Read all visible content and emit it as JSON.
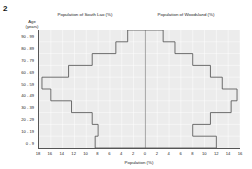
{
  "figure": {
    "number": "2"
  },
  "titles": {
    "left": "Population of South Lao (%)",
    "right": "Population of Woodsland (%)"
  },
  "axes": {
    "y_label": "Age\n(years)",
    "y_label_line1": "Age",
    "y_label_line2": "(years)",
    "x_label": "Population (%)"
  },
  "chart_data": {
    "type": "bar",
    "subtitle": "",
    "orientation": "horizontal-back-to-back",
    "style": "step-outline",
    "xlabel": "Population (%)",
    "ylabel": "Age (years)",
    "grid": true,
    "legend": "none",
    "categories": [
      "90 - 99",
      "80 - 89",
      "70 - 79",
      "60 - 69",
      "50 - 59",
      "40 - 49",
      "30 - 39",
      "20 - 29",
      "10 - 19",
      "0 - 9"
    ],
    "left_axis_ticks": [
      18,
      16,
      14,
      12,
      10,
      8,
      6,
      4,
      2,
      0
    ],
    "right_axis_ticks": [
      0,
      2,
      4,
      6,
      8,
      10,
      12,
      14,
      16
    ],
    "xlim_left": [
      0,
      18
    ],
    "xlim_right": [
      0,
      16
    ],
    "series": [
      {
        "name": "Population of South Lao (%)",
        "side": "left",
        "values": [
          3.0,
          5.0,
          9.0,
          13.0,
          17.5,
          16.0,
          12.5,
          9.0,
          8.0,
          8.5
        ]
      },
      {
        "name": "Population of Woodsland (%)",
        "side": "right",
        "values": [
          3.0,
          5.0,
          8.0,
          11.0,
          13.0,
          15.5,
          14.5,
          11.0,
          8.0,
          12.0
        ]
      }
    ]
  }
}
